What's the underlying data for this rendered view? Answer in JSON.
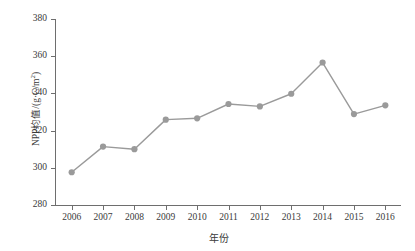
{
  "chart_data": {
    "type": "line",
    "title": "",
    "xlabel": "年份",
    "ylabel": "NPP均值/(g·C/m²)",
    "ylabel_base": "NPP均值/(g·C/m",
    "ylabel_sup": "2",
    "ylabel_tail": ")",
    "categories": [
      "2006",
      "2007",
      "2008",
      "2009",
      "2010",
      "2011",
      "2012",
      "2013",
      "2014",
      "2015",
      "2016"
    ],
    "x": [
      2006,
      2007,
      2008,
      2009,
      2010,
      2011,
      2012,
      2013,
      2014,
      2015,
      2016
    ],
    "values": [
      297.6,
      311.4,
      310.0,
      325.9,
      326.6,
      334.3,
      333.0,
      339.8,
      356.6,
      328.9,
      333.6
    ],
    "ylim": [
      280,
      380
    ],
    "ytick_values": [
      280,
      300,
      320,
      340,
      360,
      380
    ],
    "ytick_labels": [
      "280",
      "300",
      "320",
      "340",
      "360",
      "380"
    ],
    "grid": false,
    "legend": null,
    "series": [
      {
        "name": "NPP均值",
        "values": [
          297.6,
          311.4,
          310.0,
          325.9,
          326.6,
          334.3,
          333.0,
          339.8,
          356.6,
          328.9,
          333.6
        ],
        "color": "#9a9a9a",
        "marker": "circle",
        "marker_size": 5,
        "line_width": 1.4
      }
    ],
    "colors": {
      "line": "#9a9a9a",
      "marker": "#9a9a9a",
      "axis": "#6e6e6e",
      "text": "#3a3a3a",
      "background": "#ffffff"
    }
  }
}
